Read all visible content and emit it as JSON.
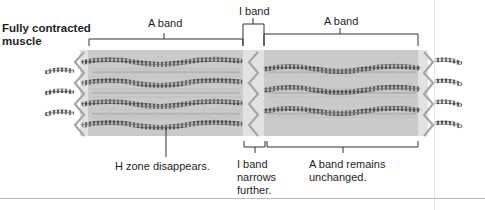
{
  "figure": {
    "title_line1": "Fully contracted",
    "title_line2": "muscle"
  },
  "top_labels": {
    "a_band_left": "A band",
    "i_band": "I band",
    "a_band_right": "A band"
  },
  "bottom_labels": {
    "h_zone": "H zone disappears.",
    "i_band_line1": "I band",
    "i_band_line2": "narrows",
    "i_band_line3": "further.",
    "a_band_line1": "A band remains",
    "a_band_line2": "unchanged."
  },
  "colors": {
    "a_band_fill": "#c9c9c9",
    "i_band_fill": "#e4e4e4",
    "thin_filament": "#5a5a5a",
    "z_disc": "#a8a8a8",
    "bracket": "#333333"
  }
}
